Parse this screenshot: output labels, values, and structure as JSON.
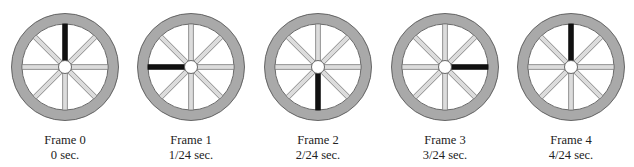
{
  "figure": {
    "colors": {
      "rim_fill": "#a9a9a9",
      "rim_stroke": "#5a5a5a",
      "spoke_fill": "#dcdcdc",
      "spoke_stroke": "#7a7a7a",
      "marked_spoke": "#111111",
      "hub_fill": "#ffffff",
      "hub_stroke": "#5a5a5a",
      "caption": "#222222"
    },
    "spoke_count": 8,
    "frames": [
      {
        "title": "Frame 0",
        "time": "0 sec.",
        "marked_spoke_direction": "up"
      },
      {
        "title": "Frame 1",
        "time": "1/24 sec.",
        "marked_spoke_direction": "left"
      },
      {
        "title": "Frame 2",
        "time": "2/24 sec.",
        "marked_spoke_direction": "down"
      },
      {
        "title": "Frame 3",
        "time": "3/24 sec.",
        "marked_spoke_direction": "right"
      },
      {
        "title": "Frame 4",
        "time": "4/24 sec.",
        "marked_spoke_direction": "up"
      }
    ]
  }
}
